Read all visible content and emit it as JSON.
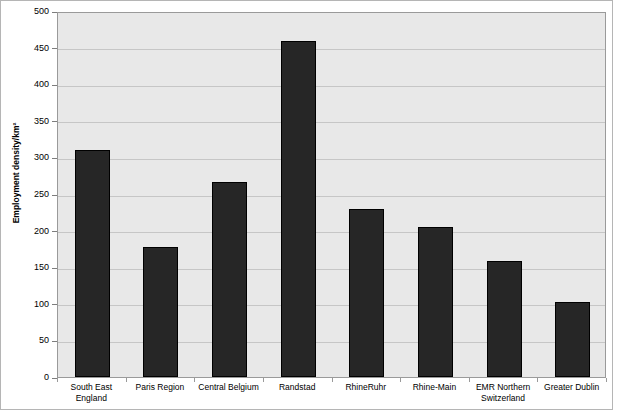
{
  "chart_data": {
    "type": "bar",
    "title": "",
    "xlabel": "",
    "ylabel": "Employment density/km²",
    "ylim": [
      0,
      500
    ],
    "yticks": [
      0,
      50,
      100,
      150,
      200,
      250,
      300,
      350,
      400,
      450,
      500
    ],
    "ytick_labels": [
      "0",
      "50",
      "100",
      "150",
      "200",
      "250",
      "300",
      "350",
      "400",
      "450",
      "500"
    ],
    "grid": "horizontal",
    "legend": "none",
    "bar_color": "#262626",
    "plot_background": "#e8e8e8",
    "gridline_color": "#c6c6c6",
    "categories": [
      "South East England",
      "Paris Region",
      "Central Belgium",
      "Randstad",
      "RhineRuhr",
      "Rhine-Main",
      "EMR Northern Switzerland",
      "Greater Dublin"
    ],
    "category_lines": [
      [
        "South East",
        "England"
      ],
      [
        "Paris Region"
      ],
      [
        "Central Belgium"
      ],
      [
        "Randstad"
      ],
      [
        "RhineRuhr"
      ],
      [
        "Rhine-Main"
      ],
      [
        "EMR Northern",
        "Switzerland"
      ],
      [
        "Greater Dublin"
      ]
    ],
    "values": [
      310,
      177,
      267,
      459,
      230,
      205,
      159,
      102
    ],
    "series": [
      {
        "name": "Employment density",
        "values": [
          310,
          177,
          267,
          459,
          230,
          205,
          159,
          102
        ]
      }
    ]
  }
}
